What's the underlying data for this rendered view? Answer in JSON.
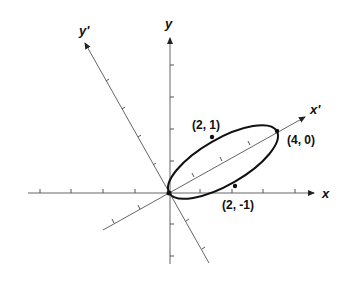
{
  "diagram": {
    "type": "rotated-axes-ellipse",
    "axes": {
      "x": {
        "label": "x"
      },
      "y": {
        "label": "y"
      },
      "x_prime": {
        "label": "x'"
      },
      "y_prime": {
        "label": "y'"
      }
    },
    "points": [
      {
        "id": "p21",
        "label": "(2, 1)"
      },
      {
        "id": "p40",
        "label": "(4, 0)"
      },
      {
        "id": "p2m1",
        "label": "(2, -1)"
      }
    ],
    "colors": {
      "curve": "#111111",
      "axis": "#666666",
      "text": "#111111"
    }
  }
}
